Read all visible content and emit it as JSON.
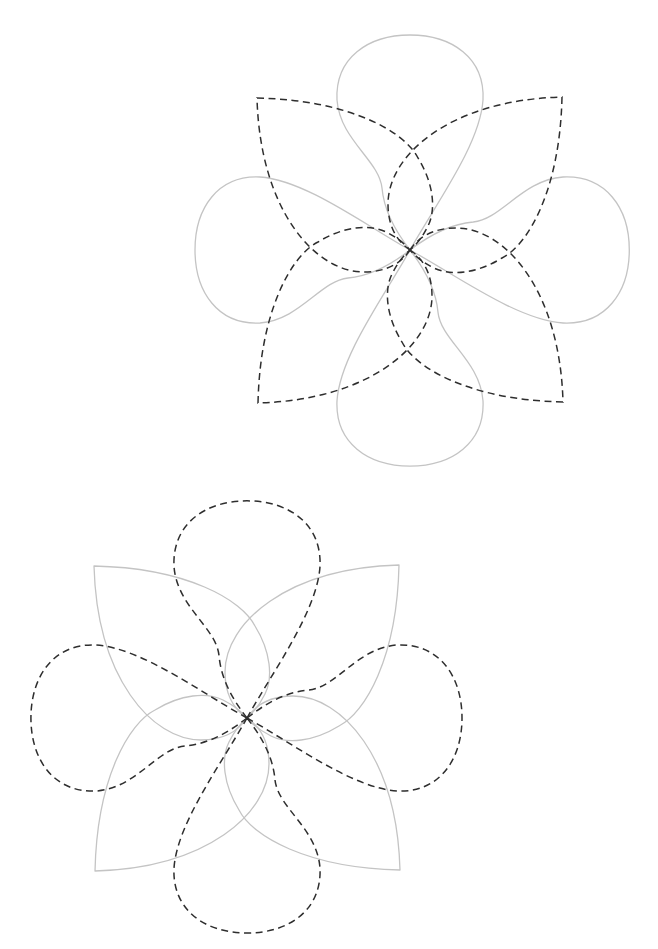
{
  "diagram": {
    "canvas": {
      "width": 658,
      "height": 949,
      "background": "#ffffff"
    },
    "colors": {
      "solid_stroke": "#c4c4c4",
      "dashed_stroke": "#2e2e2e"
    },
    "figures": [
      {
        "id": "top-figure",
        "center": [
          410,
          250
        ],
        "teardrop_style": "solid",
        "leaf_style": "dashed",
        "teardrop_count": 4,
        "leaf_count": 4,
        "leaf_corners": [
          [
            257,
            98
          ],
          [
            563,
            97
          ],
          [
            564,
            403
          ],
          [
            258,
            404
          ]
        ],
        "teardrop_tips": [
          [
            410,
            35
          ],
          [
            630,
            250
          ],
          [
            410,
            467
          ],
          [
            195,
            250
          ]
        ]
      },
      {
        "id": "bottom-figure",
        "center": [
          247,
          718
        ],
        "teardrop_style": "dashed",
        "leaf_style": "solid",
        "teardrop_count": 4,
        "leaf_count": 4,
        "leaf_corners": [
          [
            94,
            565
          ],
          [
            400,
            565
          ],
          [
            399,
            871
          ],
          [
            94,
            872
          ]
        ],
        "teardrop_tips": [
          [
            247,
            500
          ],
          [
            463,
            718
          ],
          [
            247,
            933
          ],
          [
            30,
            718
          ]
        ]
      }
    ]
  }
}
